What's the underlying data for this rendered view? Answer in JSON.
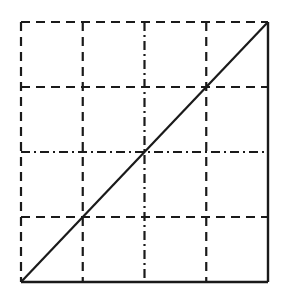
{
  "chart_data": {
    "type": "line",
    "title": "",
    "xlabel": "",
    "ylabel": "",
    "xlim": [
      0,
      4
    ],
    "ylim": [
      0,
      4
    ],
    "grid": true,
    "grid_divisions": {
      "x": 4,
      "y": 4
    },
    "grid_x": [
      1,
      2,
      3
    ],
    "grid_y": [
      1,
      2,
      3
    ],
    "legend": null,
    "series": [
      {
        "name": "diagonal",
        "style": "solid",
        "x": [
          0,
          1,
          2,
          3,
          4
        ],
        "y": [
          0,
          1,
          2,
          3,
          4
        ]
      }
    ],
    "frame": {
      "left_edge": "dashed",
      "top_edge": "dashed",
      "right_edge": "solid",
      "bottom_edge": "solid"
    },
    "gridline_styles": {
      "vertical": [
        "dashed",
        "dash-dot",
        "dashed"
      ],
      "horizontal": [
        "dashed",
        "dash-dot",
        "dashed"
      ]
    },
    "colors": {
      "line": "#1a1a1a",
      "background": "#ffffff"
    }
  },
  "layout": {
    "plot_px": {
      "left": 21,
      "top": 22,
      "right": 268,
      "bottom": 282
    }
  }
}
